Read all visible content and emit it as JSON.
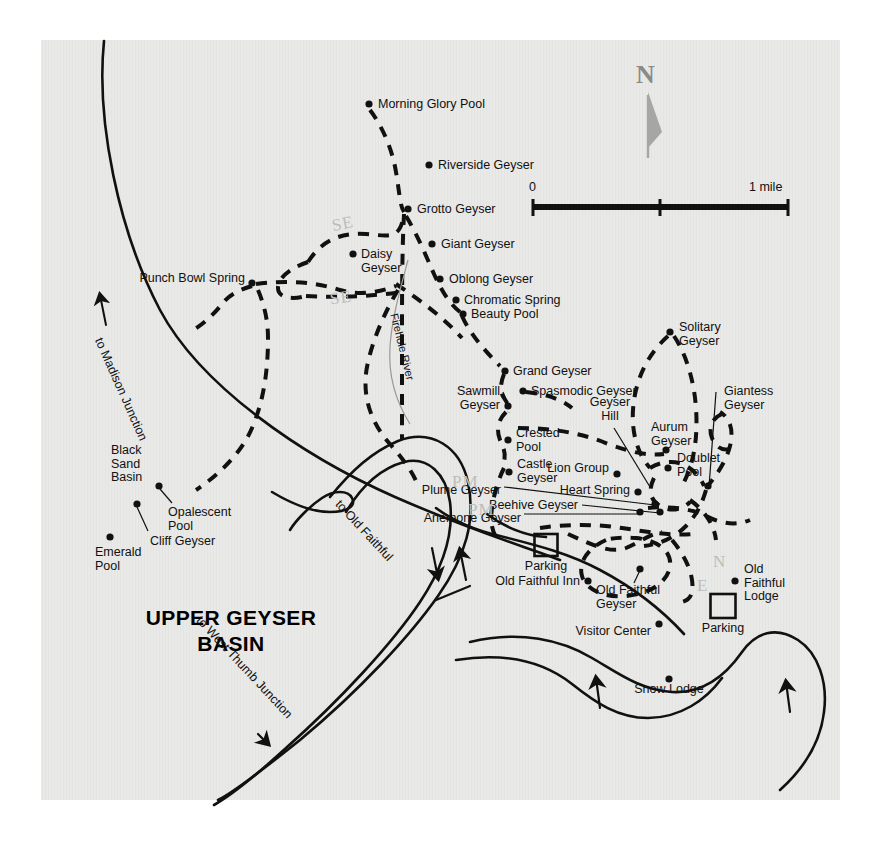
{
  "map": {
    "title_line1": "UPPER GEYSER",
    "title_line2": "BASIN",
    "background_color": "#e9e9e7",
    "ink_color": "#111111",
    "paper_color": "#ffffff"
  },
  "north_arrow": {
    "label": "N",
    "color": "#8a8a88"
  },
  "scale_bar": {
    "zero_label": "0",
    "max_label": "1 mile",
    "ticks": [
      "0",
      "",
      "1 mile"
    ]
  },
  "roads": [
    {
      "name": "to Madison Junction",
      "label": "to Madison Junction",
      "has_arrow": true
    },
    {
      "name": "to Old Faithful",
      "label": "to Old Faithful",
      "has_arrow": true
    },
    {
      "name": "to West Thumb Junction",
      "label": "to West Thumb Junction",
      "has_arrow": true
    }
  ],
  "river": {
    "label": "Firehole River"
  },
  "area_labels": [
    {
      "name": "black-sand-basin",
      "text": "Black\nSand\nBasin"
    },
    {
      "name": "geyser-hill",
      "text": "Geyser\nHill"
    }
  ],
  "features": [
    {
      "id": "morning-glory-pool",
      "label": "Morning Glory Pool",
      "x": 369,
      "y": 104,
      "lx": 378,
      "ly": 98,
      "align": "left"
    },
    {
      "id": "riverside-geyser",
      "label": "Riverside Geyser",
      "x": 429,
      "y": 165,
      "lx": 438,
      "ly": 159,
      "align": "left"
    },
    {
      "id": "grotto-geyser",
      "label": "Grotto Geyser",
      "x": 408,
      "y": 209,
      "lx": 417,
      "ly": 203,
      "align": "left"
    },
    {
      "id": "giant-geyser",
      "label": "Giant Geyser",
      "x": 432,
      "y": 244,
      "lx": 441,
      "ly": 238,
      "align": "left"
    },
    {
      "id": "daisy-geyser",
      "label": "Daisy\nGeyser",
      "x": 353,
      "y": 254,
      "lx": 361,
      "ly": 248,
      "align": "left"
    },
    {
      "id": "oblong-geyser",
      "label": "Oblong Geyser",
      "x": 440,
      "y": 279,
      "lx": 449,
      "ly": 273,
      "align": "left"
    },
    {
      "id": "punch-bowl-spring",
      "label": "Punch Bowl Spring",
      "x": 252,
      "y": 283,
      "lx": 245,
      "ly": 272,
      "align": "right"
    },
    {
      "id": "chromatic-spring",
      "label": "Chromatic Spring",
      "x": 456,
      "y": 300,
      "lx": 464,
      "ly": 294,
      "align": "left"
    },
    {
      "id": "beauty-pool",
      "label": "Beauty Pool",
      "x": 463,
      "y": 314,
      "lx": 471,
      "ly": 308,
      "align": "left"
    },
    {
      "id": "solitary-geyser",
      "label": "Solitary\nGeyser",
      "x": 670,
      "y": 332,
      "lx": 679,
      "ly": 321,
      "align": "left"
    },
    {
      "id": "grand-geyser",
      "label": "Grand Geyser",
      "x": 505,
      "y": 371,
      "lx": 513,
      "ly": 365,
      "align": "left"
    },
    {
      "id": "spasmodic-geyser",
      "label": "Spasmodic Geyser",
      "x": 523,
      "y": 391,
      "lx": 531,
      "ly": 385,
      "align": "left"
    },
    {
      "id": "sawmill-geyser",
      "label": "Sawmill\nGeyser",
      "x": 508,
      "y": 406,
      "lx": 500,
      "ly": 385,
      "align": "right"
    },
    {
      "id": "giantess-geyser",
      "label": "Giantess\nGeyser",
      "x": 708,
      "y": 486,
      "lx": 724,
      "ly": 385,
      "align": "left"
    },
    {
      "id": "aurum-geyser",
      "label": "Aurum\nGeyser",
      "x": 666,
      "y": 450,
      "lx": 651,
      "ly": 421,
      "align": "left"
    },
    {
      "id": "crested-pool",
      "label": "Crested\nPool",
      "x": 508,
      "y": 440,
      "lx": 516,
      "ly": 427,
      "align": "left"
    },
    {
      "id": "doublet-pool",
      "label": "Doublet\nPool",
      "x": 668,
      "y": 468,
      "lx": 677,
      "ly": 452,
      "align": "left"
    },
    {
      "id": "castle-geyser",
      "label": "Castle\nGeyser",
      "x": 509,
      "y": 472,
      "lx": 517,
      "ly": 458,
      "align": "left"
    },
    {
      "id": "lion-group",
      "label": "Lion Group",
      "x": 617,
      "y": 474,
      "lx": 609,
      "ly": 462,
      "align": "right"
    },
    {
      "id": "heart-spring",
      "label": "Heart Spring",
      "x": 638,
      "y": 492,
      "lx": 630,
      "ly": 484,
      "align": "right"
    },
    {
      "id": "plume-geyser",
      "label": "Plume Geyser",
      "x": 655,
      "y": 504,
      "lx": 501,
      "ly": 484,
      "align": "right"
    },
    {
      "id": "beehive-geyser",
      "label": "Beehive Geyser",
      "x": 660,
      "y": 512,
      "lx": 578,
      "ly": 499,
      "align": "right"
    },
    {
      "id": "anemone-geyser",
      "label": "Anemone Geyser",
      "x": 640,
      "y": 512,
      "lx": 521,
      "ly": 512,
      "align": "right"
    },
    {
      "id": "opalescent-pool",
      "label": "Opalescent\nPool",
      "x": 159,
      "y": 486,
      "lx": 168,
      "ly": 506,
      "align": "left"
    },
    {
      "id": "cliff-geyser",
      "label": "Cliff Geyser",
      "x": 137,
      "y": 504,
      "lx": 150,
      "ly": 535,
      "align": "left"
    },
    {
      "id": "emerald-pool",
      "label": "Emerald\nPool",
      "x": 110,
      "y": 537,
      "lx": 95,
      "ly": 546,
      "align": "left"
    },
    {
      "id": "old-faithful-inn",
      "label": "Old Faithful Inn",
      "x": 588,
      "y": 581,
      "lx": 580,
      "ly": 575,
      "align": "right"
    },
    {
      "id": "old-faithful-geyser",
      "label": "Old Faithful\nGeyser",
      "x": 640,
      "y": 569,
      "lx": 596,
      "ly": 584,
      "align": "left"
    },
    {
      "id": "old-faithful-lodge",
      "label": "Old\nFaithful\nLodge",
      "x": 735,
      "y": 581,
      "lx": 744,
      "ly": 563,
      "align": "left"
    },
    {
      "id": "visitor-center",
      "label": "Visitor Center",
      "x": 659,
      "y": 624,
      "lx": 651,
      "ly": 625,
      "align": "right"
    },
    {
      "id": "snow-lodge",
      "label": "Snow Lodge",
      "x": 669,
      "y": 679,
      "lx": 669,
      "ly": 683,
      "align": "center"
    }
  ],
  "parking_lots": [
    {
      "id": "parking-north",
      "label": "Parking",
      "x": 546,
      "y": 545,
      "w": 23,
      "h": 22
    },
    {
      "id": "parking-south",
      "label": "Parking",
      "x": 723,
      "y": 606,
      "w": 25,
      "h": 24
    }
  ],
  "pencil_marks": [
    {
      "id": "pencil-se-upper",
      "text": "SE",
      "x": 332,
      "y": 214,
      "rotate": -12
    },
    {
      "id": "pencil-se-lower",
      "text": "SE",
      "x": 330,
      "y": 288,
      "rotate": -8
    },
    {
      "id": "pencil-pm-upper",
      "text": "PM",
      "x": 452,
      "y": 472,
      "rotate": 0
    },
    {
      "id": "pencil-pm-lower",
      "text": "PM",
      "x": 468,
      "y": 500,
      "rotate": 0
    },
    {
      "id": "pencil-n-right",
      "text": "N",
      "x": 713,
      "y": 552,
      "rotate": 0
    },
    {
      "id": "pencil-e-right",
      "text": "E",
      "x": 697,
      "y": 576,
      "rotate": 0
    }
  ]
}
